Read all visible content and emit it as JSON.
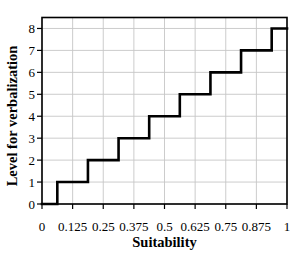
{
  "chart_data": {
    "type": "line",
    "subtype": "step",
    "title": "",
    "xlabel": "Suitability",
    "ylabel": "Level for verbalization",
    "xlim": [
      0,
      1
    ],
    "ylim": [
      0,
      8.5
    ],
    "grid": true,
    "legend": "none",
    "x_ticks": [
      0,
      0.125,
      0.25,
      0.375,
      0.5,
      0.625,
      0.75,
      0.875,
      1
    ],
    "x_tick_labels": [
      "0",
      "0.125",
      "0.25",
      "0.375",
      "0.5",
      "0.625",
      "0.75",
      "0.875",
      "1"
    ],
    "y_ticks": [
      0,
      1,
      2,
      3,
      4,
      5,
      6,
      7,
      8
    ],
    "y_tick_labels": [
      "0",
      "1",
      "2",
      "3",
      "4",
      "5",
      "6",
      "7",
      "8"
    ],
    "series": [
      {
        "name": "verbalization-level-step",
        "color": "#000000",
        "line_width": 2.6,
        "points": [
          [
            0,
            0
          ],
          [
            0.0625,
            0
          ],
          [
            0.0625,
            1
          ],
          [
            0.1875,
            1
          ],
          [
            0.1875,
            2
          ],
          [
            0.3125,
            2
          ],
          [
            0.3125,
            3
          ],
          [
            0.4375,
            3
          ],
          [
            0.4375,
            4
          ],
          [
            0.5625,
            4
          ],
          [
            0.5625,
            5
          ],
          [
            0.6875,
            5
          ],
          [
            0.6875,
            6
          ],
          [
            0.8125,
            6
          ],
          [
            0.8125,
            7
          ],
          [
            0.9375,
            7
          ],
          [
            0.9375,
            8
          ],
          [
            1,
            8
          ]
        ]
      }
    ],
    "colors": {
      "axis": "#000000",
      "grid": "#c6c6c6",
      "background": "#ffffff",
      "line": "#000000"
    }
  }
}
